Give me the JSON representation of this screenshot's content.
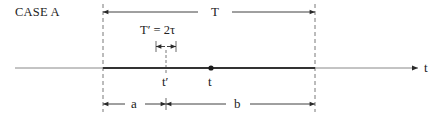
{
  "title": "CASE A",
  "axis": {
    "label": "t"
  },
  "labels": {
    "total_interval": "T",
    "sub_interval": "T′ = 2τ",
    "t_prime": "t′",
    "t_point": "t",
    "segment_a": "a",
    "segment_b": "b"
  },
  "colors": {
    "line": "#2a2a2a",
    "axis": "#888888",
    "thick": "#333333"
  }
}
